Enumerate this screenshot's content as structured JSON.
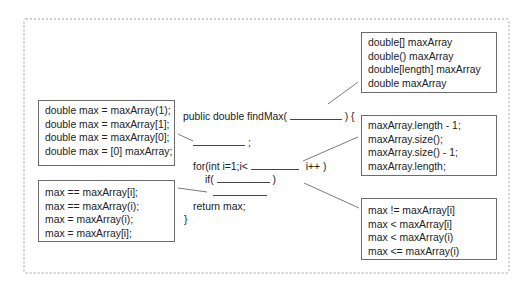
{
  "code": {
    "signature_prefix": "public double findMax(",
    "signature_suffix": ") {",
    "blank_statement_suffix": ";",
    "for_prefix": "for(int i=1;i<",
    "for_suffix": "i++ )",
    "if_prefix": "if(",
    "if_suffix": ")",
    "return_line": "return max;",
    "closing_brace": "}"
  },
  "option_boxes": {
    "parameter": {
      "options": [
        "double[] maxArray",
        "double() maxArray",
        "double[length] maxArray",
        "double maxArray"
      ]
    },
    "initialization": {
      "options": [
        "double max = maxArray(1);",
        "double max = maxArray[1];",
        "double max = maxArray[0];",
        "double max = [0] maxArray;"
      ]
    },
    "loop_bound": {
      "options": [
        "maxArray.length - 1;",
        "maxArray.size();",
        "maxArray.size() - 1;",
        "maxArray.length;"
      ]
    },
    "condition": {
      "options": [
        "max != maxArray[i]",
        "max < maxArray[i]",
        "max < maxArray(i)",
        "max <= maxArray(i)"
      ]
    },
    "assignment": {
      "options": [
        "max == maxArray[i];",
        "max == maxArray(i);",
        "max = maxArray(i);",
        "max = maxArray[i];"
      ]
    }
  },
  "colors": {
    "frame_border": "#cfcfcf",
    "box_border": "#6b6b6b",
    "connector": "#6b6b6b",
    "text": "#222222"
  }
}
